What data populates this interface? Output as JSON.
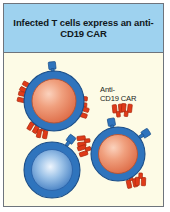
{
  "figure": {
    "header": {
      "title": "Infected T cells express an anti-CD19 CAR",
      "background_color": "#9ed2ef",
      "text_color": "#101820"
    },
    "body": {
      "background_color": "#fdfbe6",
      "border_color": "#6e747c"
    },
    "annotations": {
      "car_label": "Anti-\nCD19 CAR"
    },
    "palette": {
      "cell_membrane_blue": "#2f74bd",
      "cell_membrane_blue_dark": "#1e5a9c",
      "infected_nucleus_orange": "#e0714a",
      "infected_nucleus_highlight": "#f6b79a",
      "uninfected_nucleus_blue": "#2f6fba",
      "uninfected_nucleus_highlight": "#cfe2f5",
      "car_receptor_red": "#e03a18",
      "car_receptor_red_dark": "#b22a0f",
      "tcr_receptor_blue": "#2f74bd"
    },
    "cells": [
      {
        "id": "infected-t-cell-top-left",
        "state": "infected",
        "nucleus_color": "#e0714a",
        "car_receptor_count": 4,
        "tcr_receptor_count": 1
      },
      {
        "id": "infected-t-cell-right",
        "state": "infected",
        "nucleus_color": "#e0714a",
        "car_receptor_count": 4,
        "tcr_receptor_count": 2
      },
      {
        "id": "uninfected-t-cell-bottom-left",
        "state": "uninfected",
        "nucleus_color": "#2f6fba",
        "car_receptor_count": 0,
        "tcr_receptor_count": 1
      }
    ]
  }
}
